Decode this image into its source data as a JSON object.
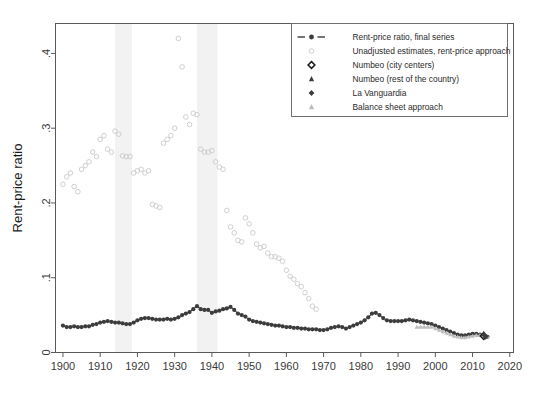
{
  "figure": {
    "title": "",
    "background_color": "#ffffff"
  },
  "axes": {
    "y_title": "Rent-price ratio",
    "y_ticks": [
      "0",
      ".1",
      ".2",
      ".3",
      ".4"
    ],
    "x_ticks": [
      "1900",
      "1910",
      "1920",
      "1930",
      "1940",
      "1950",
      "1960",
      "1970",
      "1980",
      "1990",
      "2000",
      "2010",
      "2020"
    ]
  },
  "legend": {
    "items": [
      {
        "label": "Rent-price ratio, final series",
        "marker": "line-with-circle-marker",
        "color": "#3c3c3c"
      },
      {
        "label": "Unadjusted estimates, rent-price approach",
        "marker": "open-circle",
        "color": "#c9c9c9"
      },
      {
        "label": "Numbeo (city centers)",
        "marker": "open-diamond",
        "color": "#1a1a1a"
      },
      {
        "label": "Numbeo (rest of the country)",
        "marker": "filled-triangle",
        "color": "#3c3c3c"
      },
      {
        "label": "La Vanguardia",
        "marker": "filled-diamond",
        "color": "#3c3c3c"
      },
      {
        "label": "Balance sheet approach",
        "marker": "filled-triangle-light",
        "color": "#bdbdbd"
      }
    ]
  },
  "chart_data": {
    "type": "scatter",
    "title": "",
    "xlabel": "",
    "ylabel": "Rent-price ratio",
    "xlim": [
      1898,
      2021
    ],
    "ylim": [
      0,
      0.44
    ],
    "grid": false,
    "legend_position": "top-right",
    "shaded_bands": [
      {
        "name": "band-1",
        "x0": 1914,
        "x1": 1918.5,
        "color": "#f2f2f2"
      },
      {
        "name": "band-2",
        "x0": 1936,
        "x1": 1941.5,
        "color": "#f2f2f2"
      }
    ],
    "series": [
      {
        "name": "Rent-price ratio, final series",
        "marker": "filled-circle",
        "color": "#3c3c3c",
        "connected": true,
        "x": [
          1900,
          1901,
          1902,
          1903,
          1904,
          1905,
          1906,
          1907,
          1908,
          1909,
          1910,
          1911,
          1912,
          1913,
          1914,
          1915,
          1916,
          1917,
          1918,
          1919,
          1920,
          1921,
          1922,
          1923,
          1924,
          1925,
          1926,
          1927,
          1928,
          1929,
          1930,
          1931,
          1932,
          1933,
          1934,
          1935,
          1936,
          1937,
          1938,
          1939,
          1940,
          1941,
          1942,
          1943,
          1944,
          1945,
          1946,
          1947,
          1948,
          1949,
          1950,
          1951,
          1952,
          1953,
          1954,
          1955,
          1956,
          1957,
          1958,
          1959,
          1960,
          1961,
          1962,
          1963,
          1964,
          1965,
          1966,
          1967,
          1968,
          1969,
          1970,
          1971,
          1972,
          1973,
          1974,
          1975,
          1976,
          1977,
          1978,
          1979,
          1980,
          1981,
          1982,
          1983,
          1984,
          1985,
          1986,
          1987,
          1988,
          1989,
          1990,
          1991,
          1992,
          1993,
          1994,
          1995,
          1996,
          1997,
          1998,
          1999,
          2000,
          2001,
          2002,
          2003,
          2004,
          2005,
          2006,
          2007,
          2008,
          2009,
          2010,
          2011,
          2012,
          2013,
          2014
        ],
        "y": [
          0.036,
          0.034,
          0.034,
          0.035,
          0.034,
          0.034,
          0.035,
          0.035,
          0.037,
          0.038,
          0.04,
          0.041,
          0.042,
          0.041,
          0.04,
          0.04,
          0.039,
          0.038,
          0.038,
          0.04,
          0.043,
          0.045,
          0.046,
          0.046,
          0.045,
          0.044,
          0.044,
          0.044,
          0.045,
          0.044,
          0.045,
          0.047,
          0.05,
          0.052,
          0.054,
          0.058,
          0.062,
          0.058,
          0.057,
          0.057,
          0.053,
          0.055,
          0.056,
          0.058,
          0.059,
          0.061,
          0.057,
          0.052,
          0.05,
          0.048,
          0.044,
          0.042,
          0.041,
          0.04,
          0.039,
          0.038,
          0.037,
          0.036,
          0.036,
          0.035,
          0.034,
          0.034,
          0.033,
          0.033,
          0.032,
          0.032,
          0.031,
          0.031,
          0.031,
          0.03,
          0.03,
          0.031,
          0.033,
          0.034,
          0.035,
          0.034,
          0.032,
          0.034,
          0.036,
          0.038,
          0.04,
          0.043,
          0.047,
          0.052,
          0.053,
          0.05,
          0.046,
          0.043,
          0.042,
          0.042,
          0.042,
          0.042,
          0.043,
          0.044,
          0.043,
          0.042,
          0.041,
          0.04,
          0.039,
          0.038,
          0.036,
          0.034,
          0.032,
          0.03,
          0.028,
          0.026,
          0.024,
          0.023,
          0.023,
          0.024,
          0.025,
          0.025,
          0.024,
          0.022,
          0.021
        ]
      },
      {
        "name": "Unadjusted estimates, rent-price approach",
        "marker": "open-circle",
        "color": "#c9c9c9",
        "connected": false,
        "x": [
          1900,
          1901,
          1902,
          1903,
          1904,
          1905,
          1906,
          1907,
          1908,
          1909,
          1910,
          1911,
          1912,
          1913,
          1914,
          1915,
          1916,
          1917,
          1918,
          1919,
          1920,
          1921,
          1922,
          1923,
          1924,
          1925,
          1926,
          1927,
          1928,
          1929,
          1930,
          1931,
          1932,
          1933,
          1934,
          1935,
          1936,
          1937,
          1938,
          1939,
          1940,
          1941,
          1942,
          1943,
          1944,
          1945,
          1946,
          1947,
          1948,
          1949,
          1950,
          1951,
          1952,
          1953,
          1954,
          1955,
          1956,
          1957,
          1958,
          1959,
          1960,
          1961,
          1962,
          1963,
          1964,
          1965,
          1966,
          1967,
          1968
        ],
        "y": [
          0.225,
          0.235,
          0.24,
          0.222,
          0.215,
          0.245,
          0.25,
          0.255,
          0.268,
          0.262,
          0.285,
          0.29,
          0.272,
          0.268,
          0.296,
          0.292,
          0.263,
          0.262,
          0.262,
          0.24,
          0.243,
          0.245,
          0.24,
          0.243,
          0.198,
          0.196,
          0.194,
          0.28,
          0.285,
          0.29,
          0.3,
          0.42,
          0.382,
          0.315,
          0.305,
          0.32,
          0.318,
          0.272,
          0.268,
          0.268,
          0.27,
          0.255,
          0.248,
          0.245,
          0.19,
          0.168,
          0.16,
          0.15,
          0.148,
          0.18,
          0.172,
          0.16,
          0.145,
          0.14,
          0.142,
          0.133,
          0.128,
          0.128,
          0.126,
          0.122,
          0.11,
          0.102,
          0.098,
          0.092,
          0.088,
          0.08,
          0.072,
          0.062,
          0.058
        ]
      },
      {
        "name": "Balance sheet approach",
        "marker": "filled-triangle-light",
        "color": "#bdbdbd",
        "connected": true,
        "x": [
          1995,
          1996,
          1997,
          1998,
          1999,
          2000,
          2001,
          2002,
          2003,
          2004,
          2005,
          2006,
          2007,
          2008,
          2009,
          2010,
          2011,
          2012,
          2013,
          2014
        ],
        "y": [
          0.034,
          0.034,
          0.034,
          0.034,
          0.034,
          0.032,
          0.03,
          0.028,
          0.026,
          0.024,
          0.022,
          0.021,
          0.02,
          0.02,
          0.021,
          0.022,
          0.023,
          0.023,
          0.022,
          0.021
        ]
      },
      {
        "name": "Numbeo (city centers)",
        "marker": "open-diamond",
        "color": "#1a1a1a",
        "connected": false,
        "x": [
          2013
        ],
        "y": [
          0.022
        ]
      },
      {
        "name": "Numbeo (rest of the country)",
        "marker": "filled-triangle",
        "color": "#3c3c3c",
        "connected": false,
        "x": [
          2013
        ],
        "y": [
          0.025
        ]
      },
      {
        "name": "La Vanguardia",
        "marker": "filled-diamond",
        "color": "#3c3c3c",
        "connected": false,
        "x": [
          2013.5
        ],
        "y": [
          0.021
        ]
      }
    ]
  }
}
